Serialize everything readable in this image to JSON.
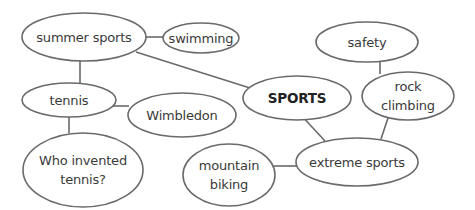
{
  "diagram": {
    "type": "mind-map",
    "colors": {
      "stroke": "#6a6a6a",
      "text": "#3a3a3a",
      "central_text": "#222222",
      "background": "#ffffff"
    },
    "nodes": [
      {
        "id": "sports",
        "lines": [
          "SPORTS"
        ],
        "central": true,
        "cx": 297,
        "cy": 98,
        "rx": 54,
        "ry": 22
      },
      {
        "id": "summer-sports",
        "lines": [
          "summer sports"
        ],
        "cx": 84,
        "cy": 37,
        "rx": 62,
        "ry": 24
      },
      {
        "id": "swimming",
        "lines": [
          "swimming"
        ],
        "cx": 201,
        "cy": 38,
        "rx": 38,
        "ry": 15
      },
      {
        "id": "tennis",
        "lines": [
          "tennis"
        ],
        "cx": 69,
        "cy": 100,
        "rx": 47,
        "ry": 17
      },
      {
        "id": "wimbledon",
        "lines": [
          "Wimbledon"
        ],
        "cx": 182,
        "cy": 115,
        "rx": 54,
        "ry": 22
      },
      {
        "id": "who-invented-tennis",
        "lines": [
          "Who invented",
          "tennis?"
        ],
        "cx": 83,
        "cy": 170,
        "rx": 60,
        "ry": 37
      },
      {
        "id": "safety",
        "lines": [
          "safety"
        ],
        "cx": 367,
        "cy": 42,
        "rx": 51,
        "ry": 20
      },
      {
        "id": "rock-climbing",
        "lines": [
          "rock",
          "climbing"
        ],
        "cx": 408,
        "cy": 96,
        "rx": 46,
        "ry": 24
      },
      {
        "id": "extreme-sports",
        "lines": [
          "extreme sports"
        ],
        "cx": 357,
        "cy": 162,
        "rx": 61,
        "ry": 24
      },
      {
        "id": "mountain-biking",
        "lines": [
          "mountain",
          "biking"
        ],
        "cx": 229,
        "cy": 175,
        "rx": 46,
        "ry": 31
      }
    ],
    "edges": [
      {
        "from": "summer-sports",
        "to": "swimming",
        "x1": 146,
        "y1": 37,
        "x2": 163,
        "y2": 37
      },
      {
        "from": "summer-sports",
        "to": "sports",
        "x1": 136,
        "y1": 52,
        "x2": 250,
        "y2": 88
      },
      {
        "from": "summer-sports",
        "to": "tennis",
        "x1": 80,
        "y1": 61,
        "x2": 80,
        "y2": 83
      },
      {
        "from": "tennis",
        "to": "wimbledon",
        "x1": 112,
        "y1": 106,
        "x2": 129,
        "y2": 106
      },
      {
        "from": "tennis",
        "to": "who-invented-tennis",
        "x1": 69,
        "y1": 117,
        "x2": 69,
        "y2": 133
      },
      {
        "from": "sports",
        "to": "extreme-sports",
        "x1": 299,
        "y1": 113,
        "x2": 325,
        "y2": 141
      },
      {
        "from": "safety",
        "to": "rock-climbing",
        "x1": 380,
        "y1": 61,
        "x2": 380,
        "y2": 74
      },
      {
        "from": "rock-climbing",
        "to": "extreme-sports",
        "x1": 388,
        "y1": 118,
        "x2": 381,
        "y2": 139
      },
      {
        "from": "mountain-biking",
        "to": "extreme-sports",
        "x1": 274,
        "y1": 166,
        "x2": 297,
        "y2": 166
      }
    ]
  }
}
